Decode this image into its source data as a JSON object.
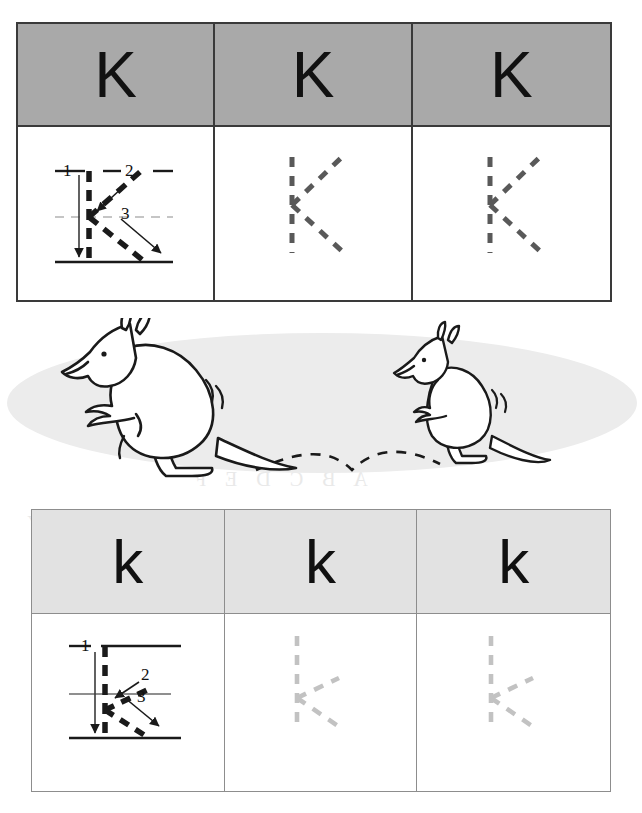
{
  "worksheet": {
    "letter_uppercase": "K",
    "letter_lowercase": "k",
    "stroke_numbers": [
      "1",
      "2",
      "3"
    ]
  },
  "uppercase_table": {
    "header_bg": "#a9a9a9",
    "border_color": "#3a3a3a",
    "trace_color": "#595959",
    "columns": [
      {
        "model_letter": "K",
        "practice_kind": "stroke-guide"
      },
      {
        "model_letter": "K",
        "practice_kind": "dashed-trace"
      },
      {
        "model_letter": "K",
        "practice_kind": "dashed-trace"
      }
    ]
  },
  "lowercase_table": {
    "header_bg": "#e2e2e2",
    "border_color": "#8d8d8d",
    "trace_color": "#c2c2c2",
    "columns": [
      {
        "model_letter": "k",
        "practice_kind": "stroke-guide"
      },
      {
        "model_letter": "k",
        "practice_kind": "dashed-trace"
      },
      {
        "model_letter": "k",
        "practice_kind": "dashed-trace"
      }
    ]
  },
  "illustration": {
    "subject": "kangaroos",
    "ground_color": "#ececec",
    "line_color": "#1a1a1a",
    "big_kangaroo_label": "kangaroo-large",
    "small_kangaroo_label": "kangaroo-small",
    "hop_trail_label": "hop-trail-dashed"
  },
  "bleed_through": {
    "line_a": "A B C D E F",
    "line_b": "N O P Q R S T U V W X Y",
    "line_c": "What letter is this here"
  }
}
